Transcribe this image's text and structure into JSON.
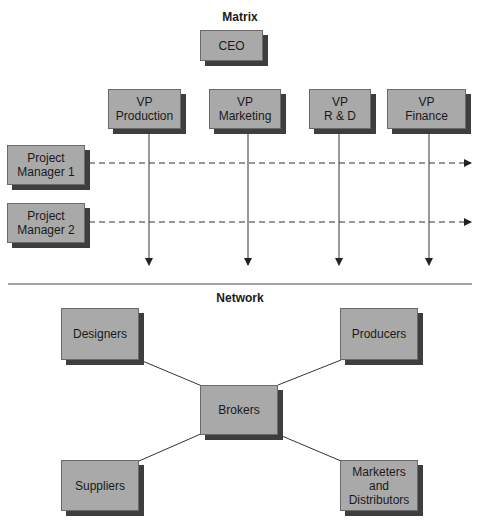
{
  "matrix": {
    "title": "Matrix",
    "ceo": "CEO",
    "vps": [
      {
        "label": "VP\nProduction"
      },
      {
        "label": "VP\nMarketing"
      },
      {
        "label": "VP\nR & D"
      },
      {
        "label": "VP\nFinance"
      }
    ],
    "project_managers": [
      {
        "label": "Project\nManager 1"
      },
      {
        "label": "Project\nManager 2"
      }
    ]
  },
  "network": {
    "title": "Network",
    "center": "Brokers",
    "nodes": [
      {
        "label": "Designers"
      },
      {
        "label": "Producers"
      },
      {
        "label": "Suppliers"
      },
      {
        "label": "Marketers\nand\nDistributors"
      }
    ]
  },
  "colors": {
    "box_fill": "#a9a9a9",
    "box_shadow": "#3e3e3e",
    "line": "#333333"
  }
}
